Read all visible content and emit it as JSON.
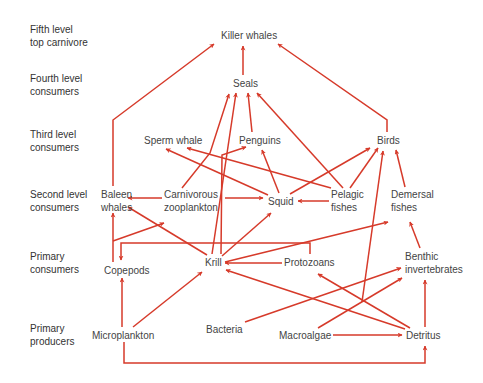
{
  "colors": {
    "arrow": "#d63a2a",
    "text": "#444444",
    "level_text": "#333333"
  },
  "levels": [
    {
      "id": "fifth",
      "line1": "Fifth level",
      "line2": "top carnivore"
    },
    {
      "id": "fourth",
      "line1": "Fourth level",
      "line2": "consumers"
    },
    {
      "id": "third",
      "line1": "Third level",
      "line2": "consumers"
    },
    {
      "id": "second",
      "line1": "Second level",
      "line2": "consumers"
    },
    {
      "id": "primary-consumers",
      "line1": "Primary",
      "line2": "consumers"
    },
    {
      "id": "primary-producers",
      "line1": "Primary",
      "line2": "producers"
    }
  ],
  "nodes": {
    "killer_whales": {
      "label": "Killer whales",
      "level": "fifth"
    },
    "seals": {
      "label": "Seals",
      "level": "fourth"
    },
    "sperm_whale": {
      "label": "Sperm whale",
      "level": "third"
    },
    "penguins": {
      "label": "Penguins",
      "level": "third"
    },
    "birds": {
      "label": "Birds",
      "level": "third"
    },
    "baleen_whales": {
      "line1": "Baleen",
      "line2": "whales",
      "level": "second"
    },
    "carnivorous_zooplankton": {
      "line1": "Carnivorous",
      "line2": "zooplankton",
      "level": "second"
    },
    "squid": {
      "label": "Squid",
      "level": "second"
    },
    "pelagic_fishes": {
      "line1": "Pelagic",
      "line2": "fishes",
      "level": "second"
    },
    "demersal_fishes": {
      "line1": "Demersal",
      "line2": "fishes",
      "level": "second"
    },
    "copepods": {
      "label": "Copepods",
      "level": "primary-consumers"
    },
    "krill": {
      "label": "Krill",
      "level": "primary-consumers"
    },
    "protozoans": {
      "label": "Protozoans",
      "level": "primary-consumers"
    },
    "benthic_invertebrates": {
      "line1": "Benthic",
      "line2": "invertebrates",
      "level": "primary-consumers"
    },
    "microplankton": {
      "label": "Microplankton",
      "level": "primary-producers"
    },
    "bacteria": {
      "label": "Bacteria",
      "level": "primary-producers"
    },
    "macroalgae": {
      "label": "Macroalgae",
      "level": "primary-producers"
    },
    "detritus": {
      "label": "Detritus",
      "level": "primary-producers"
    }
  },
  "edges": [
    {
      "from": "seals",
      "to": "killer_whales"
    },
    {
      "from": "baleen_whales",
      "to": "killer_whales"
    },
    {
      "from": "birds",
      "to": "killer_whales"
    },
    {
      "from": "krill",
      "to": "seals"
    },
    {
      "from": "carnivorous_zooplankton",
      "to": "seals"
    },
    {
      "from": "penguins",
      "to": "seals"
    },
    {
      "from": "pelagic_fishes",
      "to": "seals"
    },
    {
      "from": "squid",
      "to": "sperm_whale"
    },
    {
      "from": "pelagic_fishes",
      "to": "sperm_whale"
    },
    {
      "from": "krill",
      "to": "penguins"
    },
    {
      "from": "squid",
      "to": "penguins"
    },
    {
      "from": "squid",
      "to": "birds"
    },
    {
      "from": "pelagic_fishes",
      "to": "birds"
    },
    {
      "from": "demersal_fishes",
      "to": "birds"
    },
    {
      "from": "benthic_invertebrates",
      "to": "birds"
    },
    {
      "from": "carnivorous_zooplankton",
      "to": "baleen_whales"
    },
    {
      "from": "krill",
      "to": "baleen_whales"
    },
    {
      "from": "copepods",
      "to": "baleen_whales"
    },
    {
      "from": "copepods",
      "to": "carnivorous_zooplankton"
    },
    {
      "from": "carnivorous_zooplankton",
      "to": "squid"
    },
    {
      "from": "pelagic_fishes",
      "to": "squid"
    },
    {
      "from": "krill",
      "to": "squid"
    },
    {
      "from": "krill",
      "to": "demersal_fishes"
    },
    {
      "from": "benthic_invertebrates",
      "to": "demersal_fishes"
    },
    {
      "from": "protozoans",
      "to": "copepods"
    },
    {
      "from": "microplankton",
      "to": "copepods"
    },
    {
      "from": "protozoans",
      "to": "krill"
    },
    {
      "from": "microplankton",
      "to": "krill"
    },
    {
      "from": "detritus",
      "to": "krill"
    },
    {
      "from": "detritus",
      "to": "protozoans"
    },
    {
      "from": "bacteria",
      "to": "benthic_invertebrates"
    },
    {
      "from": "macroalgae",
      "to": "benthic_invertebrates"
    },
    {
      "from": "detritus",
      "to": "benthic_invertebrates"
    },
    {
      "from": "macroalgae",
      "to": "detritus"
    },
    {
      "from": "microplankton",
      "to": "detritus"
    }
  ]
}
